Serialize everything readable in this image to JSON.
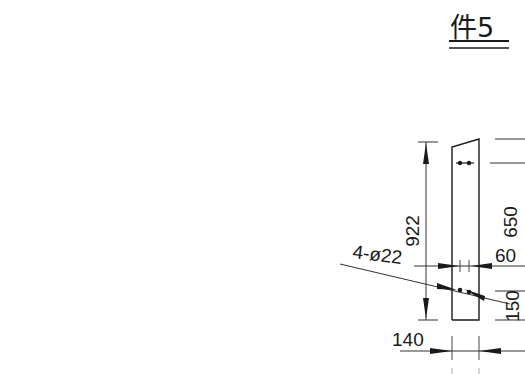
{
  "drawing": {
    "title": "件5",
    "part_label": "件5",
    "colors": {
      "background": "#ffffff",
      "line": "#1a1a1a",
      "thin_line": "#333333"
    },
    "dimensions": {
      "overall_height": "922",
      "hole_spacing_vertical": "650",
      "hole_spacing_horizontal": "60",
      "bottom_offset": "150",
      "width": "140",
      "holes": "4-ø22"
    }
  }
}
